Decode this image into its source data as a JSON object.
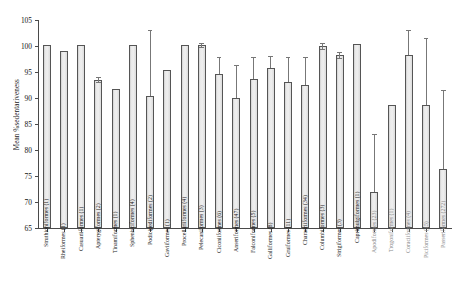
{
  "chart_data": {
    "type": "bar",
    "title": "",
    "xlabel": "",
    "ylabel": "Mean %sedentariveness",
    "ylim": [
      65,
      105
    ],
    "yticks": [
      65,
      70,
      75,
      80,
      85,
      90,
      95,
      100,
      105
    ],
    "grid": false,
    "legend": null,
    "categories": [
      "Struthioniformes (1)",
      "Rheiformes (1)",
      "Casuariiformes (1)",
      "Apterygiformes (2)",
      "Tinamiformes (1)",
      "Sphenisciformes (4)",
      "Podicipediformes (2)",
      "Gaviiformes (1)",
      "Procellariiformes (4)",
      "Pelecaniformes (3)",
      "Ciconiiformes (6)",
      "Anseriformes (47)",
      "Falconiformes (5)",
      "Galliformes (8)",
      "Gruiformes (11)",
      "Charadriiformes (34)",
      "Columbiformes (3)",
      "Strigiformes (3)",
      "Caprimulgiformes (1)",
      "Apodiformes (23)",
      "Trogoniformes (1)",
      "Coraciiformes (4)",
      "Piciformes (15)",
      "Passeriformes (272)"
    ],
    "values": [
      100.2,
      99.1,
      100.2,
      93.5,
      91.7,
      100.2,
      90.4,
      95.4,
      100.2,
      100.2,
      94.6,
      90.0,
      93.7,
      95.8,
      93.0,
      92.5,
      100.0,
      98.3,
      100.3,
      72.0,
      88.7,
      98.3,
      88.7,
      76.3
    ],
    "error_upper": [
      100.2,
      99.1,
      100.2,
      94.0,
      91.7,
      100.2,
      103.0,
      95.4,
      100.2,
      100.6,
      97.9,
      96.4,
      97.9,
      98.0,
      97.8,
      97.9,
      100.5,
      98.9,
      100.3,
      83.0,
      88.7,
      103.0,
      101.5,
      91.5
    ],
    "error_lower": [
      100.2,
      99.1,
      100.2,
      93.0,
      91.7,
      100.2,
      90.4,
      95.4,
      100.2,
      99.8,
      94.6,
      90.0,
      93.7,
      95.8,
      93.0,
      92.5,
      99.5,
      97.7,
      100.3,
      72.0,
      88.7,
      98.3,
      88.7,
      76.3
    ],
    "gray_labels": [
      "Apodiformes (23)",
      "Trogoniformes (1)",
      "Coraciiformes (4)",
      "Piciformes (15)",
      "Passeriformes (272)"
    ],
    "colors": {
      "bar_fill": "#e9e9e9",
      "bar_stroke": "#555555",
      "error_bar": "#777777",
      "axis": "#4a4a4a",
      "text": "#1a1a1a",
      "gray_text": "#8a8a8a"
    }
  }
}
